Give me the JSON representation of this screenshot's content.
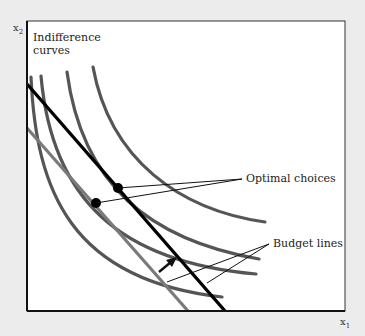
{
  "diagram": {
    "title_label": "Indifference curves",
    "title_line1": "Indifference",
    "title_line2": "curves",
    "y_axis": {
      "symbol": "x",
      "subscript": "2"
    },
    "x_axis": {
      "symbol": "x",
      "subscript": "1"
    },
    "annotations": {
      "optimal_choices": "Optimal choices",
      "budget_lines": "Budget lines"
    },
    "colors": {
      "background": "#ececec",
      "plot_area": "#ffffff",
      "indifference_curve": "#555555",
      "budget_line_old": "#7a7a7a",
      "budget_line_new": "#000000",
      "frame": "#111111"
    },
    "elements": {
      "indifference_curves": 5,
      "budget_lines": 2,
      "optimal_points": 2,
      "shift_arrow": "budget line shifts outward (rotation)"
    }
  }
}
